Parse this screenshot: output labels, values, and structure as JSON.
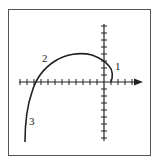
{
  "figure": {
    "type": "curve-sketch",
    "labels": [
      {
        "id": "region-1",
        "text": "1",
        "x": 115,
        "y": 70
      },
      {
        "id": "region-2",
        "text": "2",
        "x": 42,
        "y": 62
      },
      {
        "id": "region-3",
        "text": "3",
        "x": 29,
        "y": 125
      }
    ],
    "axes": {
      "x_axis": {
        "has_arrow": true,
        "ticks_left": 12,
        "ticks_right": 4
      },
      "y_axis": {
        "has_arrow": false,
        "ticks_above": 8,
        "ticks_below": 8
      }
    },
    "colors": {
      "stroke": "#222222",
      "frame": "#555555",
      "background": "#ffffff"
    }
  }
}
